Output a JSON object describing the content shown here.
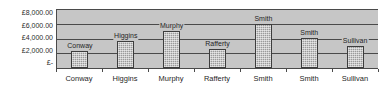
{
  "chart_data": {
    "type": "bar",
    "title": "",
    "xlabel": "",
    "ylabel": "",
    "categories": [
      "Conway",
      "Higgins",
      "Murphy",
      "Rafferty",
      "Smith",
      "Smith",
      "Sullivan"
    ],
    "values": [
      2350,
      3600,
      5000,
      2600,
      6000,
      4100,
      3000
    ],
    "data_labels": [
      "Conway",
      "Higgins",
      "Murphy",
      "Rafferty",
      "Smith",
      "Smith",
      "Sullivan"
    ],
    "ylim": [
      0,
      8000
    ],
    "ytick_values": [
      8000,
      6000,
      4000,
      2000,
      0
    ],
    "ytick_labels": [
      "£8,000.00",
      "£6,000.00",
      "£4,000.00",
      "£2,000.00",
      "£-"
    ],
    "currency_symbol": "£",
    "grid": true,
    "legend": false,
    "legend_position": "none",
    "colors": {
      "bar_fill": "#9a9a9a",
      "bar_border": "#3d3d3d",
      "plot_background": "#c6c6c6",
      "gridline": "#4a4a4a",
      "axis": "#4a4a4a",
      "text": "#1f1f1f",
      "page_background": "#ffffff"
    }
  }
}
